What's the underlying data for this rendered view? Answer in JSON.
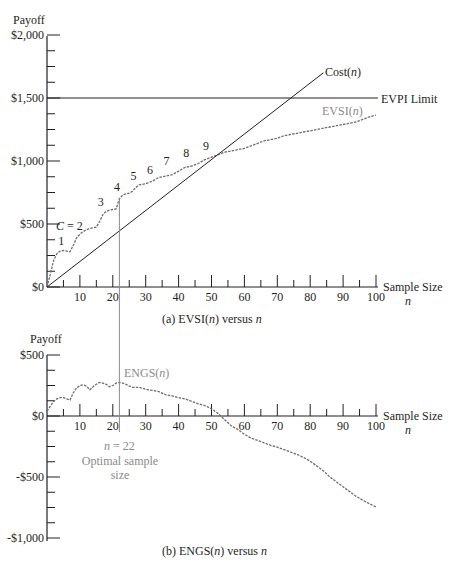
{
  "colors": {
    "ink": "#231f20",
    "curve": "#6e6e6e",
    "annotation": "#8a8a8a",
    "background": "#ffffff"
  },
  "chart_data": [
    {
      "id": "a",
      "type": "line",
      "title": "(a) EVSI(n) versus n",
      "ylabel": "Payoff",
      "xlabel": "Sample Size",
      "xlabel_var": "n",
      "xlim": [
        0,
        100
      ],
      "ylim": [
        0,
        2000
      ],
      "x_ticks": [
        10,
        20,
        30,
        40,
        50,
        60,
        70,
        80,
        90,
        100
      ],
      "y_tick_labels": [
        "$0",
        "$500",
        "$1,000",
        "$1,500",
        "$2,000"
      ],
      "y_tick_values": [
        0,
        500,
        1000,
        1500,
        2000
      ],
      "grid": false,
      "series": [
        {
          "name": "EVSI(n)",
          "style": "dashed-gray",
          "x": [
            0,
            1,
            2,
            3,
            4,
            5,
            6,
            7,
            8,
            9,
            10,
            11,
            12,
            13,
            14,
            15,
            16,
            17,
            18,
            19,
            20,
            21,
            22,
            23,
            24,
            25,
            26,
            27,
            28,
            29,
            30,
            32,
            34,
            36,
            38,
            40,
            42,
            44,
            46,
            48,
            50,
            52,
            54,
            56,
            58,
            60,
            62,
            64,
            66,
            68,
            70,
            72,
            74,
            76,
            78,
            80,
            82,
            84,
            86,
            88,
            90,
            92,
            94,
            96,
            98,
            100
          ],
          "values": [
            0,
            100,
            210,
            265,
            285,
            290,
            285,
            280,
            330,
            390,
            420,
            440,
            455,
            465,
            470,
            475,
            520,
            575,
            600,
            610,
            615,
            620,
            700,
            730,
            740,
            745,
            760,
            790,
            810,
            815,
            820,
            840,
            870,
            880,
            890,
            920,
            950,
            960,
            980,
            1010,
            1030,
            1050,
            1070,
            1080,
            1090,
            1100,
            1120,
            1140,
            1160,
            1170,
            1180,
            1200,
            1210,
            1220,
            1230,
            1240,
            1250,
            1260,
            1270,
            1280,
            1290,
            1300,
            1310,
            1330,
            1350,
            1365
          ]
        },
        {
          "name": "Cost(n)",
          "style": "solid",
          "x": [
            0,
            84
          ],
          "values": [
            0,
            1700
          ]
        },
        {
          "name": "EVPI Limit",
          "style": "solid",
          "x": [
            0,
            100
          ],
          "values": [
            1500,
            1500
          ]
        }
      ],
      "annotations": [
        {
          "text": "C = 2",
          "x": 4,
          "y": 530
        },
        {
          "text": "1",
          "x": 4,
          "y": 330
        },
        {
          "text": "3",
          "x": 16,
          "y": 640
        },
        {
          "text": "4",
          "x": 21,
          "y": 760
        },
        {
          "text": "5",
          "x": 26,
          "y": 850
        },
        {
          "text": "6",
          "x": 31,
          "y": 900
        },
        {
          "text": "7",
          "x": 36,
          "y": 970
        },
        {
          "text": "8",
          "x": 42,
          "y": 1030
        },
        {
          "text": "9",
          "x": 48,
          "y": 1090
        }
      ],
      "labels": {
        "cost": "Cost(n)",
        "evpi": "EVPI Limit",
        "evsi": "EVSI(n)"
      }
    },
    {
      "id": "b",
      "type": "line",
      "title": "(b) ENGS(n) versus n",
      "ylabel": "Payoff",
      "xlabel": "Sample Size",
      "xlabel_var": "n",
      "xlim": [
        0,
        100
      ],
      "ylim": [
        -1000,
        500
      ],
      "x_ticks": [
        10,
        20,
        30,
        40,
        50,
        60,
        70,
        80,
        90,
        100
      ],
      "y_tick_labels": [
        "-$1,000",
        "-$500",
        "$0",
        "$500"
      ],
      "y_tick_values": [
        -1000,
        -500,
        0,
        500
      ],
      "grid": false,
      "series": [
        {
          "name": "ENGS(n)",
          "style": "dashed-gray",
          "x": [
            0,
            1,
            2,
            3,
            4,
            5,
            6,
            7,
            8,
            9,
            10,
            11,
            12,
            13,
            14,
            15,
            16,
            17,
            18,
            19,
            20,
            21,
            22,
            23,
            24,
            25,
            26,
            28,
            30,
            32,
            34,
            36,
            38,
            40,
            42,
            44,
            46,
            48,
            50,
            52,
            54,
            56,
            58,
            60,
            62,
            64,
            66,
            68,
            70,
            72,
            74,
            76,
            78,
            80,
            82,
            84,
            86,
            88,
            90,
            92,
            94,
            96,
            98,
            100
          ],
          "values": [
            40,
            80,
            120,
            140,
            150,
            150,
            140,
            130,
            190,
            230,
            250,
            255,
            245,
            215,
            240,
            260,
            275,
            270,
            260,
            240,
            250,
            270,
            275,
            270,
            260,
            245,
            235,
            235,
            220,
            210,
            200,
            175,
            165,
            150,
            140,
            120,
            100,
            85,
            60,
            20,
            -30,
            -80,
            -110,
            -150,
            -180,
            -200,
            -220,
            -240,
            -255,
            -275,
            -295,
            -315,
            -340,
            -370,
            -410,
            -450,
            -500,
            -540,
            -580,
            -620,
            -660,
            -690,
            -720,
            -745
          ]
        }
      ],
      "optimal": {
        "n": 22,
        "label_n": "n = 22",
        "label_text": "Optimal sample size",
        "label_line1": "Optimal sample",
        "label_line2": "size"
      },
      "labels": {
        "engs": "ENGS(n)"
      }
    }
  ],
  "text": {
    "payoff_a": "Payoff",
    "payoff_b": "Payoff",
    "sample_size": "Sample Size",
    "n_var": "n",
    "caption_a_pre": "(a) EVSI(",
    "caption_a_post": ") versus ",
    "caption_b_pre": "(b) ENGS(",
    "caption_b_post": ") versus ",
    "cost_pre": "Cost(",
    "close_paren": ")",
    "evpi": "EVPI Limit",
    "evsi_pre": "EVSI(",
    "engs_pre": "ENGS(",
    "c_eq": "C = 2",
    "n_eq_22": "= 22",
    "optimal_1": "Optimal sample",
    "optimal_2": "size"
  }
}
